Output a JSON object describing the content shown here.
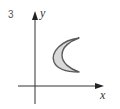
{
  "figure": {
    "number_label": "3",
    "x_axis_label": "x",
    "y_axis_label": "y",
    "shape": "crescent",
    "colors": {
      "axis": "#333333",
      "shape_fill": "#d9d9d9",
      "shape_stroke": "#5a5a5a"
    }
  }
}
